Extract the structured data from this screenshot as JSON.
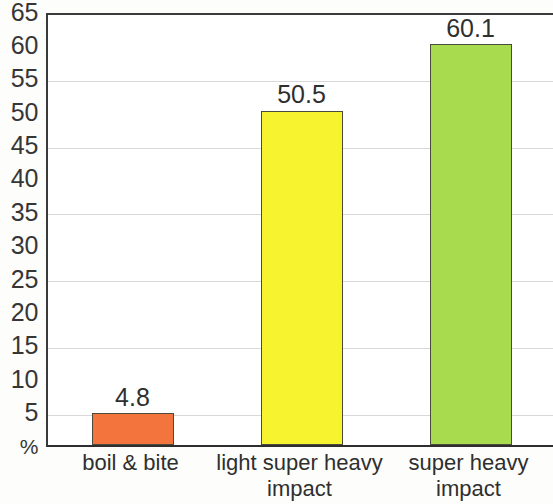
{
  "chart_data": {
    "type": "bar",
    "title": "",
    "subtitle": "",
    "xlabel": "",
    "ylabel": "%",
    "categories": [
      "boil & bite",
      "light super heavy\nimpact",
      "super heavy\nimpact"
    ],
    "values": [
      4.8,
      50.1,
      60.1
    ],
    "value_labels": [
      "4.8",
      "50.5",
      "60.1"
    ],
    "series": [
      {
        "name": "",
        "values": [
          4.8,
          50.5,
          60.1
        ]
      }
    ],
    "bar_colors": [
      "#F4743E",
      "#F7F32E",
      "#A8DC4E"
    ],
    "bar_border_color": "#4a4a3d",
    "ylim": [
      0,
      65
    ],
    "ytick_step": 5,
    "ytick_labels": [
      "65",
      "60",
      "55",
      "50",
      "45",
      "40",
      "35",
      "30",
      "25",
      "20",
      "15",
      "10",
      "5",
      "%"
    ],
    "ytick_values": [
      65,
      60,
      55,
      50,
      45,
      40,
      35,
      30,
      25,
      20,
      15,
      10,
      5,
      0
    ],
    "gridlines_at": [
      55,
      45,
      35,
      25,
      15,
      5
    ],
    "grid": true,
    "legend": "none",
    "legend_position": "none",
    "axis_color": "#2e2e2e",
    "grid_color": "#d8d8d8",
    "background_color": "#ffffff"
  },
  "axis": {
    "y_labels": [
      {
        "text": "65",
        "value": 65
      },
      {
        "text": "60",
        "value": 60
      },
      {
        "text": "55",
        "value": 55
      },
      {
        "text": "50",
        "value": 50
      },
      {
        "text": "45",
        "value": 45
      },
      {
        "text": "40",
        "value": 40
      },
      {
        "text": "35",
        "value": 35
      },
      {
        "text": "30",
        "value": 30
      },
      {
        "text": "25",
        "value": 25
      },
      {
        "text": "20",
        "value": 20
      },
      {
        "text": "15",
        "value": 15
      },
      {
        "text": "10",
        "value": 10
      },
      {
        "text": "5",
        "value": 5
      },
      {
        "text": "%",
        "value": 0
      }
    ],
    "x_labels": [
      {
        "line1": "boil & bite",
        "line2": ""
      },
      {
        "line1": "light super heavy",
        "line2": "impact"
      },
      {
        "line1": "super heavy",
        "line2": "impact"
      }
    ]
  },
  "bars": [
    {
      "label": "boil & bite",
      "value_label": "4.8",
      "color": "#F4743E"
    },
    {
      "label": "light super heavy impact",
      "value_label": "50.5",
      "color": "#F7F32E"
    },
    {
      "label": "super heavy impact",
      "value_label": "60.1",
      "color": "#A8DC4E"
    }
  ]
}
